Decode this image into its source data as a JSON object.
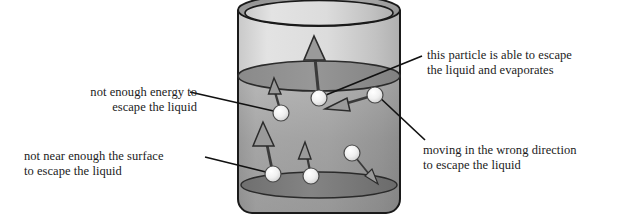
{
  "diagram": {
    "labels": {
      "not_enough_energy": "not enough energy to\nescape the liquid",
      "not_near_surface": "not near enough the surface\nto escape the liquid",
      "able_to_escape": "this particle is able to escape\nthe liquid and evaporates",
      "wrong_direction": "moving in the wrong direction\nto escape the liquid"
    },
    "colors": {
      "background": "#ffffff",
      "text": "#1b1b1b",
      "outline": "#1a1a1a",
      "vapour_light": "#d8d8d8",
      "liquid_top": "#b7b7b7",
      "liquid_bottom": "#8e8e8e",
      "liquid_surface": "#8c8c8c",
      "container_rim": "#9a9a9a",
      "container_base": "#7a7a7a",
      "particle_fill": "#f2f2f2",
      "arrow_fill": "#8a8a8a",
      "leader_line": "#111111"
    },
    "container": {
      "name": "beaker",
      "left": 238,
      "right": 400,
      "top": 10,
      "bottom": 213,
      "rim_ellipse_ry": 16,
      "liquid_surface_y": 76,
      "base_ellipse_ry": 14
    },
    "particles": [
      {
        "id": "particle-not-enough-energy",
        "cx": 281,
        "cy": 113,
        "r": 8,
        "arrow": {
          "to_x": 274,
          "to_y": 83,
          "width": 7,
          "head": 13
        }
      },
      {
        "id": "particle-escapes",
        "cx": 319,
        "cy": 98,
        "r": 8,
        "arrow": {
          "to_x": 314,
          "to_y": 40,
          "width": 11,
          "head": 20
        }
      },
      {
        "id": "particle-wrong-direction",
        "cx": 375,
        "cy": 95,
        "r": 8,
        "arrow": {
          "to_x": 330,
          "to_y": 108,
          "width": 10,
          "head": 19
        }
      },
      {
        "id": "particle-not-near-surface",
        "cx": 273,
        "cy": 174,
        "r": 8,
        "arrow": {
          "to_x": 264,
          "to_y": 127,
          "width": 10,
          "head": 19
        }
      },
      {
        "id": "particle-bottom-middle",
        "cx": 311,
        "cy": 176,
        "r": 8,
        "arrow": {
          "to_x": 306,
          "to_y": 147,
          "width": 7,
          "head": 13
        }
      },
      {
        "id": "particle-bottom-right",
        "cx": 352,
        "cy": 153,
        "r": 8,
        "arrow": {
          "to_x": 374,
          "to_y": 181,
          "width": 5,
          "head": 10
        }
      }
    ],
    "leader_lines": [
      {
        "id": "leader-not-enough-energy",
        "x1": 190,
        "y1": 92,
        "x2": 278,
        "y2": 112
      },
      {
        "id": "leader-not-near-surface",
        "x1": 205,
        "y1": 157,
        "x2": 270,
        "y2": 173
      },
      {
        "id": "leader-able-to-escape",
        "x1": 422,
        "y1": 56,
        "x2": 321,
        "y2": 97
      },
      {
        "id": "leader-wrong-direction",
        "x1": 425,
        "y1": 140,
        "x2": 377,
        "y2": 95
      }
    ]
  }
}
